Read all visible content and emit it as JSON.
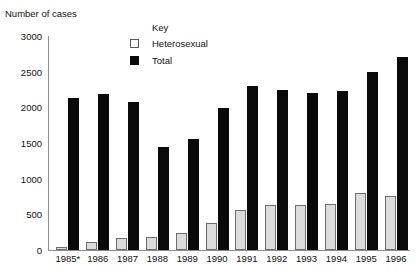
{
  "chart_data": {
    "type": "bar",
    "title": "",
    "xlabel": "",
    "ylabel": "Number of cases",
    "ylim": [
      0,
      3000
    ],
    "ytick_labels": [
      "3000",
      "2500",
      "2000",
      "1500",
      "1000",
      "500",
      "0"
    ],
    "yticks": [
      3000,
      2500,
      2000,
      1500,
      1000,
      500,
      0
    ],
    "grid": false,
    "legend_position": "top-center",
    "legend_title": "Key",
    "categories": [
      "1985*",
      "1986",
      "1987",
      "1988",
      "1989",
      "1990",
      "1991",
      "1992",
      "1993",
      "1994",
      "1995",
      "1996"
    ],
    "series": [
      {
        "name": "Heterosexual",
        "color": "#dcdcdc",
        "values": [
          45,
          115,
          170,
          180,
          240,
          385,
          565,
          630,
          625,
          650,
          795,
          760
        ]
      },
      {
        "name": "Total",
        "color": "#0a0a0a",
        "values": [
          2130,
          2190,
          2080,
          1450,
          1550,
          1990,
          2300,
          2240,
          2200,
          2230,
          2500,
          2710
        ]
      }
    ]
  },
  "axis": {
    "y_title": "Number of cases"
  },
  "legend": {
    "title": "Key",
    "items": [
      {
        "label": "Heterosexual",
        "swatch": "light-square-icon"
      },
      {
        "label": "Total",
        "swatch": "dark-square-icon"
      }
    ]
  }
}
